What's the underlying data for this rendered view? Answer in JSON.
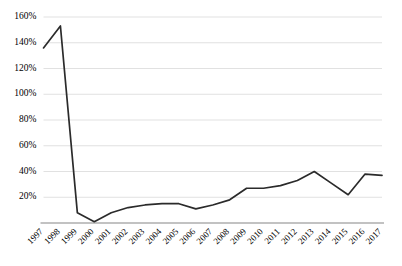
{
  "chart_data": {
    "type": "line",
    "title": "",
    "subtitle": "",
    "xlabel": "",
    "ylabel": "",
    "categories": [
      "1997",
      "1998",
      "1999",
      "2000",
      "2001",
      "2002",
      "2003",
      "2004",
      "2005",
      "2006",
      "2007",
      "2008",
      "2009",
      "2010",
      "2011",
      "2012",
      "2013",
      "2014",
      "2015",
      "2016",
      "2017"
    ],
    "series": [
      {
        "name": "",
        "values": [
          136,
          153,
          8,
          1,
          8,
          12,
          14,
          15,
          15,
          11,
          14,
          18,
          27,
          27,
          29,
          33,
          40,
          31,
          22,
          38,
          37
        ]
      }
    ],
    "ylim": [
      0,
      160
    ],
    "ytick_values": [
      0,
      20,
      40,
      60,
      80,
      100,
      120,
      140,
      160
    ],
    "ytick_labels": [
      "0%",
      "20%",
      "40%",
      "60%",
      "80%",
      "100%",
      "120%",
      "140%",
      "160%"
    ],
    "ytick_labels_shown": [
      "20%",
      "40%",
      "60%",
      "80%",
      "100%",
      "120%",
      "140%",
      "160%"
    ],
    "grid": true,
    "grid_axis": "y",
    "legend": false,
    "legend_position": "none",
    "line_color": "#2b2b2b",
    "grid_color": "#d9d9d9",
    "axis_color": "#868686",
    "background": "#ffffff",
    "xtick_rotation": -45,
    "annotations": []
  }
}
